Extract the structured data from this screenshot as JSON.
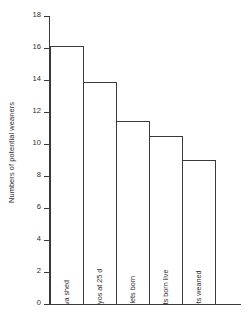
{
  "chart_data": {
    "type": "bar",
    "title": "",
    "xlabel": "",
    "ylabel": "Numbers of potential weaners",
    "categories": [
      "ova shed",
      "embryos at 25 d",
      "piglets born",
      "piglets born live",
      "piglets weaned"
    ],
    "values": [
      16.1,
      13.85,
      11.45,
      10.5,
      9.0
    ],
    "ylim": [
      0,
      18
    ],
    "ytick_labels": [
      "0",
      "2",
      "4",
      "6",
      "8",
      "10",
      "12",
      "14",
      "16",
      "18"
    ],
    "ytick_values": [
      0,
      2,
      4,
      6,
      8,
      10,
      12,
      14,
      16,
      18
    ],
    "grid": false,
    "legend": null,
    "bar_fill_color": "#ffffff",
    "bar_edge_color": "#3a3a3a",
    "axis_color": "#3a3a3a",
    "text_color": "#2e2e2e",
    "background_color": "#ffffff"
  }
}
